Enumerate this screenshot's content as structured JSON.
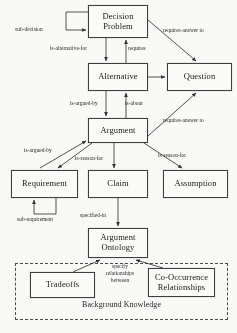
{
  "diagram": {
    "nodes": [
      {
        "id": "decision-problem",
        "label": "Decision\nProblem",
        "line1": "Decision",
        "line2": "Problem",
        "x": 88,
        "y": 5,
        "w": 60,
        "h": 33
      },
      {
        "id": "alternative",
        "label": "Alternative",
        "x": 88,
        "y": 63,
        "w": 60,
        "h": 28
      },
      {
        "id": "question",
        "label": "Question",
        "x": 167,
        "y": 63,
        "w": 65,
        "h": 28
      },
      {
        "id": "argument",
        "label": "Argument",
        "x": 88,
        "y": 118,
        "w": 60,
        "h": 25
      },
      {
        "id": "requirement",
        "label": "Requirement",
        "x": 11,
        "y": 170,
        "w": 67,
        "h": 28
      },
      {
        "id": "claim",
        "label": "Claim",
        "x": 88,
        "y": 170,
        "w": 60,
        "h": 28
      },
      {
        "id": "assumption",
        "label": "Assumption",
        "x": 163,
        "y": 170,
        "w": 65,
        "h": 28
      },
      {
        "id": "argument-ontology",
        "label": "Argument\nOntology",
        "line1": "Argument",
        "line2": "Ontology",
        "x": 88,
        "y": 228,
        "w": 60,
        "h": 30
      },
      {
        "id": "tradeoffs",
        "label": "Tradeoffs",
        "x": 30,
        "y": 272,
        "w": 65,
        "h": 26
      },
      {
        "id": "co-occurrence-relationships",
        "label": "Co-Occurrence\nRelationships",
        "line1": "Co-Occurrence",
        "line2": "Relationships",
        "x": 148,
        "y": 268,
        "w": 67,
        "h": 29
      }
    ],
    "container": {
      "id": "background-knowledge",
      "label": "Background Knowledge",
      "x": 15,
      "y": 263,
      "w": 213,
      "h": 57
    },
    "edge_labels": [
      {
        "id": "sub-decision",
        "text": "sub-decision",
        "x": 15,
        "y": 26
      },
      {
        "id": "is-alternative-for",
        "text": "is-alternative-for",
        "x": 50,
        "y": 45
      },
      {
        "id": "requires",
        "text": "requires",
        "x": 128,
        "y": 45
      },
      {
        "id": "requires-answer-to-top",
        "text": "requires-answer to",
        "x": 163,
        "y": 27
      },
      {
        "id": "is-argued-by-alternative",
        "text": "is-argued-by",
        "x": 70,
        "y": 100
      },
      {
        "id": "is-about",
        "text": "is-about",
        "x": 125,
        "y": 100
      },
      {
        "id": "requires-answer-to-argument",
        "text": "requires-answer to",
        "x": 163,
        "y": 117
      },
      {
        "id": "is-argued-by-requirement",
        "text": "is-argued-by",
        "x": 24,
        "y": 147
      },
      {
        "id": "is-reason-for-claim",
        "text": "is-reason-for",
        "x": 75,
        "y": 155
      },
      {
        "id": "is-reason-for-assumption",
        "text": "is-reason-for",
        "x": 158,
        "y": 152
      },
      {
        "id": "sub-requirement",
        "text": "sub-requirement",
        "x": 17,
        "y": 216
      },
      {
        "id": "specified-in",
        "text": "specified-in",
        "x": 80,
        "y": 212
      },
      {
        "id": "specify-relationships-between",
        "text": "specify\nrelationships\nbetween",
        "line1": "specify",
        "line2": "relationships",
        "line3": "between",
        "x": 99,
        "y": 263
      }
    ],
    "colors": {
      "stroke": "#2f2f2f",
      "box_border": "#3b3b3b",
      "text": "#141414",
      "background": "#fbfbf9",
      "dashed_border": "#4a4a4a"
    }
  }
}
